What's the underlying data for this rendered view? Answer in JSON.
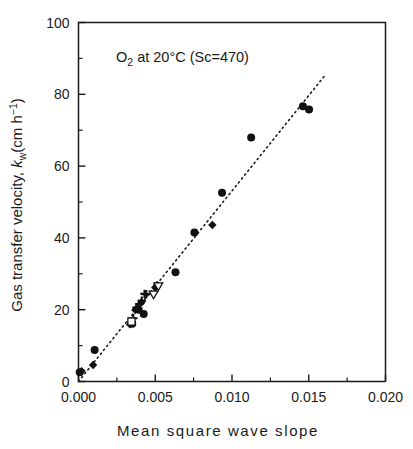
{
  "chart_data": {
    "type": "scatter",
    "title": "",
    "annotation": "O2 at 20°C (Sc=470)",
    "annotation_parts": {
      "lead": "O",
      "sub": "2",
      "mid": " at 20°C (Sc=470)"
    },
    "xlabel": "Mean square wave slope",
    "ylabel_parts": {
      "lead": "Gas transfer velocity, ",
      "symbol": "k",
      "sub": "w",
      "unit_open": "(cm h",
      "sup": "−1",
      "unit_close": ")"
    },
    "ylabel": "Gas transfer velocity, kw(cm h-1)",
    "xlim": [
      0.0,
      0.02
    ],
    "ylim": [
      0,
      100
    ],
    "xticks": [
      0.0,
      0.005,
      0.01,
      0.015,
      0.02
    ],
    "xtick_labels": [
      "0.000",
      "0.005",
      "0.010",
      "0.015",
      "0.020"
    ],
    "xticks_minor": [
      0.0025,
      0.0075,
      0.0125,
      0.0175
    ],
    "yticks": [
      0,
      20,
      40,
      60,
      80,
      100
    ],
    "ytick_labels": [
      "0",
      "20",
      "40",
      "60",
      "80",
      "100"
    ],
    "yticks_minor": [
      10,
      30,
      50,
      70,
      90
    ],
    "grid": false,
    "legend": "none",
    "axis_color": "#1a1a1a",
    "marker_color": "#111111",
    "trendline": {
      "style": "dotted",
      "x_start": 0.0,
      "y_start": 0.0,
      "x_end": 0.0161,
      "y_end": 85.5
    },
    "series": [
      {
        "name": "filled-circle",
        "marker": "circle",
        "filled": true,
        "points": [
          [
            8e-05,
            2.6
          ],
          [
            0.00105,
            8.8
          ],
          [
            0.00425,
            18.8
          ],
          [
            0.00632,
            30.4
          ],
          [
            0.00755,
            41.5
          ],
          [
            0.00935,
            52.6
          ],
          [
            0.01125,
            68.0
          ],
          [
            0.01462,
            76.7
          ],
          [
            0.01502,
            75.8
          ],
          [
            0.0035,
            16.1
          ],
          [
            0.00392,
            20.0
          ]
        ]
      },
      {
        "name": "filled-diamond",
        "marker": "diamond",
        "filled": true,
        "points": [
          [
            0.0002,
            2.9
          ],
          [
            0.00095,
            4.6
          ],
          [
            0.00335,
            15.9
          ],
          [
            0.00348,
            16.5
          ],
          [
            0.0037,
            19.9
          ],
          [
            0.00381,
            20.4
          ],
          [
            0.0041,
            22.0
          ],
          [
            0.005,
            26.2
          ],
          [
            0.00512,
            26.9
          ],
          [
            0.00872,
            43.6
          ]
        ]
      },
      {
        "name": "plus",
        "marker": "plus",
        "filled": false,
        "points": [
          [
            0.00357,
            17.6
          ],
          [
            0.00378,
            20.6
          ],
          [
            0.00396,
            21.6
          ],
          [
            0.00412,
            22.5
          ],
          [
            0.0043,
            24.4
          ],
          [
            0.00441,
            24.3
          ]
        ]
      },
      {
        "name": "open-triangle-down",
        "marker": "triangle-down",
        "filled": false,
        "points": [
          [
            0.00489,
            24.1
          ],
          [
            0.0052,
            26.4
          ]
        ]
      },
      {
        "name": "open-square",
        "marker": "square",
        "filled": false,
        "points": [
          [
            0.00345,
            16.7
          ]
        ]
      }
    ]
  }
}
